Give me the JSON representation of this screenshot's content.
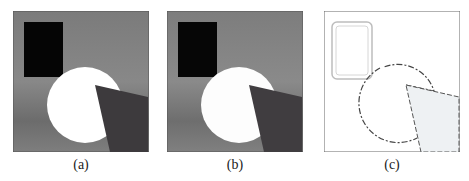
{
  "figure": {
    "panels": [
      {
        "id": "a",
        "caption": "(a)",
        "description": "Original grayscale synthetic image: black rectangle, white disk, dark wedge on gradient gray background"
      },
      {
        "id": "b",
        "caption": "(b)",
        "description": "Processed grayscale image, nearly identical to (a)"
      },
      {
        "id": "c",
        "caption": "(c)",
        "description": "Edge map: outlined rectangle, dashed circle contour, light-filled wedge on white background"
      }
    ]
  },
  "colors": {
    "bg_gray_top": "#7a7a7a",
    "bg_gray_mid": "#8a8a8a",
    "bg_gray_bottom": "#6f6f6f",
    "rectangle": "#050505",
    "disk": "#ffffff",
    "wedge": "#3c3a3c",
    "frame": "#555555",
    "edge_line": "#444444",
    "edge_fill": "#eef1f3"
  }
}
